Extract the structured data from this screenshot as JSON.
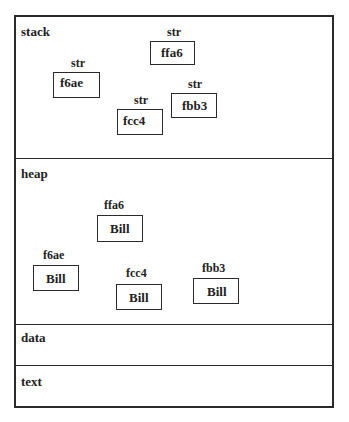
{
  "segments": {
    "stack": "stack",
    "heap": "heap",
    "data": "data",
    "text": "text"
  },
  "stack_vars": [
    {
      "type": "str",
      "value": "ffa6"
    },
    {
      "type": "str",
      "value": "f6ae"
    },
    {
      "type": "str",
      "value": "fcc4"
    },
    {
      "type": "str",
      "value": "fbb3"
    }
  ],
  "heap_objects": [
    {
      "address": "ffa6",
      "value": "Bill"
    },
    {
      "address": "f6ae",
      "value": "Bill"
    },
    {
      "address": "fcc4",
      "value": "Bill"
    },
    {
      "address": "fbb3",
      "value": "Bill"
    }
  ]
}
